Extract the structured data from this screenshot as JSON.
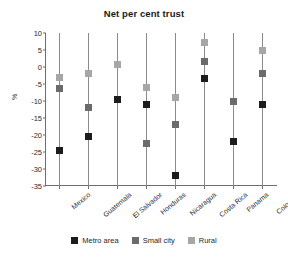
{
  "chart_data": {
    "type": "scatter",
    "title": "Net per cent trust",
    "xlabel": "",
    "ylabel": "%",
    "ylim": [
      -35,
      10
    ],
    "yticks": [
      10,
      5,
      0,
      -5,
      -10,
      -15,
      -20,
      -25,
      -30,
      -35
    ],
    "ytick_labels": [
      "10",
      "5",
      "0",
      "-5",
      "-10",
      "-15",
      "-20",
      "-25",
      "-30",
      "-35"
    ],
    "grid": false,
    "legend_position": "bottom",
    "categories": [
      "Mexico",
      "Guatemala",
      "El Salvador",
      "Honduras",
      "Nicaragua",
      "Costa Rica",
      "Panama",
      "Colombia"
    ],
    "series": [
      {
        "name": "Metro area",
        "color": "#1c1c1c",
        "values": [
          -24.7,
          -20.4,
          -9.7,
          -11.0,
          -32.0,
          -3.3,
          -22.0,
          -11.0
        ]
      },
      {
        "name": "Small city",
        "color": "#6b6b6b",
        "values": [
          -6.3,
          -12.0,
          -9.5,
          -22.4,
          -17.0,
          1.5,
          -10.0,
          -2.0
        ]
      },
      {
        "name": "Rural",
        "color": "#a6a6a6",
        "values": [
          -3.0,
          -2.0,
          0.8,
          -6.0,
          -9.0,
          7.2,
          -10.0,
          5.0
        ]
      }
    ]
  },
  "legend": {
    "items": [
      {
        "label": "Metro area",
        "color": "#1c1c1c"
      },
      {
        "label": "Small city",
        "color": "#6b6b6b"
      },
      {
        "label": "Rural",
        "color": "#a6a6a6"
      }
    ]
  }
}
